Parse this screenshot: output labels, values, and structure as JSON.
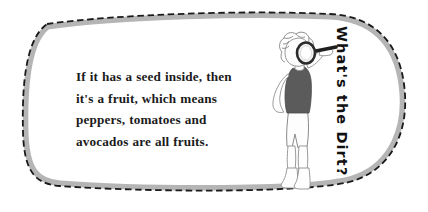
{
  "callout": {
    "body_text": "If it has a seed inside, then\nit's a fruit, which means\npeppers, tomatoes and\navocados are all fruits.",
    "lines": [
      "If it has a seed inside, then",
      "it's a fruit, which means",
      "peppers, tomatoes and",
      "avocados are all fruits."
    ],
    "vertical_title": "What's the Dirt?",
    "border_style": "dashed",
    "shape": "rounded-blob"
  },
  "illustration": {
    "name": "kid-with-magnifying-glass",
    "parts": [
      {
        "name": "hair",
        "label": "curly hair"
      },
      {
        "name": "face",
        "label": "face"
      },
      {
        "name": "magnifying-glass",
        "label": "magnifying glass"
      },
      {
        "name": "tank-top",
        "label": "sleeveless tank top"
      },
      {
        "name": "shorts",
        "label": "shorts"
      },
      {
        "name": "shoes",
        "label": "shoes"
      }
    ]
  },
  "colors": {
    "page_background": "#ffffff",
    "card_fill": "#ffffff",
    "border_dash": "#1a1a1a",
    "border_shadow": "#b5b5b5",
    "text": "#1b1b1b",
    "title_text": "#111111",
    "tank_top": "#5b5b5b",
    "outline": "#6f6f6f",
    "lens_ring": "#2b2b2b",
    "lens_fill": "#f2f2f2",
    "handle": "#1f1f1f"
  }
}
